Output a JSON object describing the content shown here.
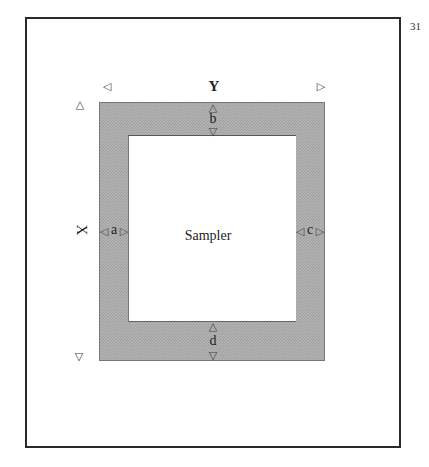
{
  "page_number": "31",
  "diagram": {
    "axis_x_label": "X",
    "axis_y_label": "Y",
    "center_label": "Sampler",
    "margins": {
      "top": "b",
      "left": "a",
      "right": "c",
      "bottom": "d"
    },
    "arrows": {
      "left": "◁",
      "right": "▷",
      "up": "△",
      "down": "▽"
    },
    "colors": {
      "frame": "#2a2a2a",
      "band_fill": "#b4b4b4",
      "inner_fill": "#ffffff"
    }
  }
}
